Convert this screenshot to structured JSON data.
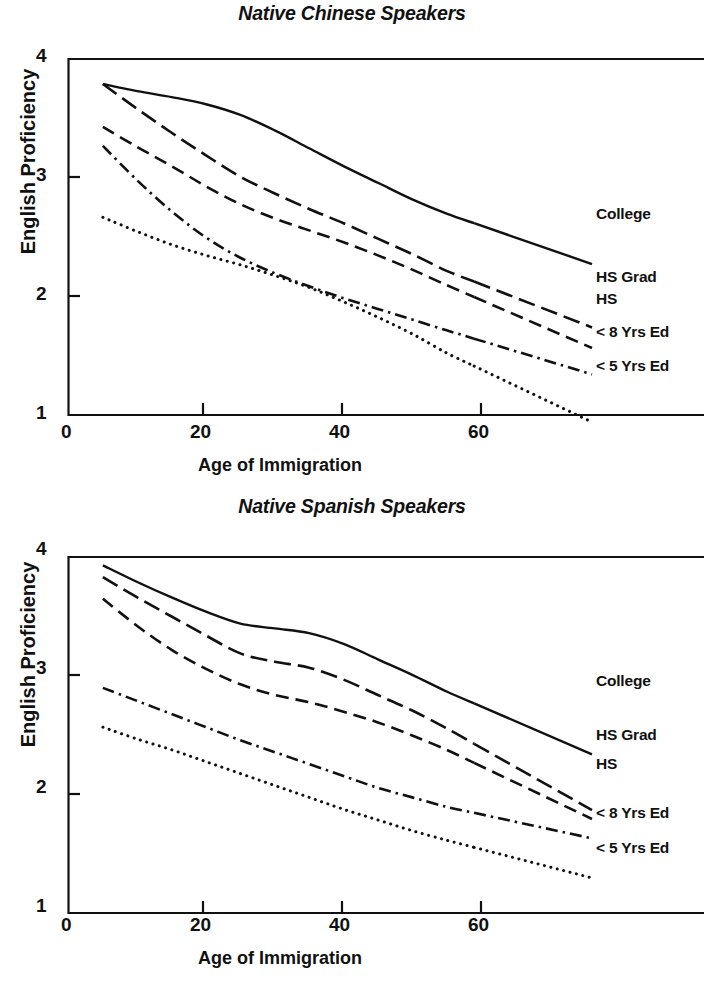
{
  "figure": {
    "charts": [
      {
        "id": "native-chinese-speakers",
        "title": "Native Chinese Speakers",
        "xlabel": "Age of Immigration",
        "ylabel": "English Proficiency",
        "xticks": [
          "0",
          "20",
          "40",
          "60"
        ],
        "yticks": [
          "4",
          "3",
          "2",
          "1"
        ],
        "labels": {
          "college": "College",
          "hs_grad": "HS Grad",
          "hs": "HS",
          "lt8": "< 8 Yrs Ed",
          "lt5": "< 5 Yrs Ed"
        }
      },
      {
        "id": "native-spanish-speakers",
        "title": "Native Spanish Speakers",
        "xlabel": "Age of Immigration",
        "ylabel": "English Proficiency",
        "xticks": [
          "0",
          "20",
          "40",
          "60"
        ],
        "yticks": [
          "4",
          "3",
          "2",
          "1"
        ],
        "labels": {
          "college": "College",
          "hs_grad": "HS Grad",
          "hs": "HS",
          "lt8": "< 8 Yrs Ed",
          "lt5": "< 5 Yrs Ed"
        }
      }
    ]
  },
  "chart_data": [
    {
      "type": "line",
      "title": "Native Chinese Speakers",
      "xlabel": "Age of Immigration",
      "ylabel": "English Proficiency",
      "xlim": [
        0,
        71
      ],
      "ylim": [
        1,
        4
      ],
      "xticks": [
        0,
        20,
        40,
        60
      ],
      "yticks": [
        1,
        2,
        3,
        4
      ],
      "grid": false,
      "legend": "right-inline-labels",
      "x": [
        5,
        10,
        15,
        20,
        25,
        30,
        35,
        40,
        45,
        50,
        55,
        59
      ],
      "series": [
        {
          "name": "College",
          "style": "solid",
          "values": [
            3.79,
            3.73,
            3.68,
            3.62,
            3.53,
            3.4,
            3.25,
            3.1,
            2.96,
            2.82,
            2.7,
            2.62
          ]
        },
        {
          "name": "HS Grad",
          "style": "long-dash",
          "values": [
            3.79,
            3.58,
            3.38,
            3.19,
            3.01,
            2.87,
            2.74,
            2.62,
            2.49,
            2.36,
            2.22,
            2.13
          ]
        },
        {
          "name": "HS",
          "style": "dash",
          "values": [
            3.43,
            3.26,
            3.1,
            2.93,
            2.78,
            2.66,
            2.56,
            2.46,
            2.35,
            2.23,
            2.1,
            2.0
          ]
        },
        {
          "name": "< 8 Yrs Ed",
          "style": "dash-dot",
          "values": [
            3.27,
            2.98,
            2.72,
            2.5,
            2.33,
            2.2,
            2.09,
            1.99,
            1.9,
            1.81,
            1.72,
            1.65
          ]
        },
        {
          "name": "< 5 Yrs Ed",
          "style": "dotted",
          "values": [
            2.67,
            2.55,
            2.44,
            2.35,
            2.27,
            2.18,
            2.08,
            1.96,
            1.83,
            1.69,
            1.53,
            1.42
          ]
        }
      ]
    },
    {
      "type": "line",
      "title": "Native Spanish Speakers",
      "xlabel": "Age of Immigration",
      "ylabel": "English Proficiency",
      "xlim": [
        0,
        71
      ],
      "ylim": [
        1,
        4
      ],
      "xticks": [
        0,
        20,
        40,
        60
      ],
      "yticks": [
        1,
        2,
        3,
        4
      ],
      "grid": false,
      "legend": "right-inline-labels",
      "x": [
        5,
        10,
        15,
        20,
        25,
        30,
        35,
        40,
        45,
        50,
        55,
        59
      ],
      "series": [
        {
          "name": "College",
          "style": "solid",
          "values": [
            3.93,
            3.79,
            3.66,
            3.54,
            3.44,
            3.4,
            3.36,
            3.27,
            3.14,
            3.01,
            2.87,
            2.77
          ]
        },
        {
          "name": "HS Grad",
          "style": "long-dash",
          "values": [
            3.83,
            3.66,
            3.5,
            3.34,
            3.19,
            3.12,
            3.07,
            2.97,
            2.84,
            2.71,
            2.56,
            2.43
          ]
        },
        {
          "name": "HS",
          "style": "dash",
          "values": [
            3.65,
            3.42,
            3.22,
            3.06,
            2.93,
            2.84,
            2.78,
            2.7,
            2.61,
            2.5,
            2.38,
            2.27
          ]
        },
        {
          "name": "< 8 Yrs Ed",
          "style": "dash-dot",
          "values": [
            2.9,
            2.79,
            2.68,
            2.57,
            2.46,
            2.36,
            2.26,
            2.16,
            2.06,
            1.98,
            1.9,
            1.85
          ]
        },
        {
          "name": "< 5 Yrs Ed",
          "style": "dotted",
          "values": [
            2.57,
            2.47,
            2.38,
            2.28,
            2.18,
            2.08,
            1.98,
            1.88,
            1.79,
            1.7,
            1.62,
            1.56
          ]
        }
      ]
    }
  ]
}
